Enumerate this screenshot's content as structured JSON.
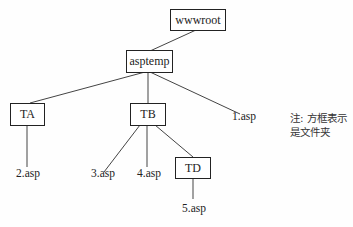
{
  "diagram": {
    "folders": {
      "root": "wwwroot",
      "asptemp": "asptemp",
      "ta": "TA",
      "tb": "TB",
      "td": "TD"
    },
    "files": {
      "f1": "1.asp",
      "f2": "2.asp",
      "f3": "3.asp",
      "f4": "4.asp",
      "f5": "5.asp"
    },
    "note": {
      "line1": "注: 方框表示",
      "line2": "是文件夹"
    },
    "edges": [
      [
        "wwwroot",
        "asptemp"
      ],
      [
        "asptemp",
        "TA"
      ],
      [
        "asptemp",
        "TB"
      ],
      [
        "asptemp",
        "1.asp"
      ],
      [
        "TA",
        "2.asp"
      ],
      [
        "TB",
        "3.asp"
      ],
      [
        "TB",
        "4.asp"
      ],
      [
        "TB",
        "TD"
      ],
      [
        "TD",
        "5.asp"
      ]
    ]
  }
}
